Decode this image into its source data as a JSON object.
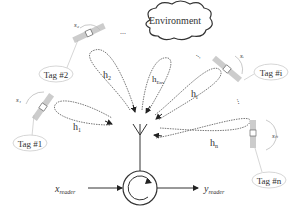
{
  "diagram": {
    "environment_label": "Environment",
    "tags": [
      {
        "id": "tag1",
        "label": "Tag #1",
        "state": "s₁"
      },
      {
        "id": "tag2",
        "label": "Tag #2",
        "state": "s₂"
      },
      {
        "id": "tagi",
        "label": "Tag #i",
        "state": "sᵢ"
      },
      {
        "id": "tagn",
        "label": "Tag #n",
        "state": "sₙ"
      }
    ],
    "channels": [
      {
        "id": "h1",
        "label": "h",
        "sub": "1"
      },
      {
        "id": "h2",
        "label": "h",
        "sub": "2"
      },
      {
        "id": "henv",
        "label": "h",
        "sub": "Env"
      },
      {
        "id": "hi",
        "label": "h",
        "sub": "i"
      },
      {
        "id": "hn",
        "label": "h",
        "sub": "n"
      }
    ],
    "ellipsis": "...",
    "reader": {
      "input_label": "x",
      "input_sub": "reader",
      "output_label": "y",
      "output_sub": "reader"
    }
  }
}
